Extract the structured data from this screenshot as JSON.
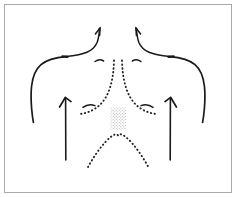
{
  "figure": {
    "title": "Anterior thorax line drawing",
    "background_color": "#ffffff",
    "frame_color": "#a8a8a8",
    "ink_color": "#1a1a1a",
    "dot_color": "#222222",
    "stipple_color": "#c9c9c9",
    "canvas": {
      "width": 236,
      "height": 197
    }
  },
  "elements": {
    "left_neck_line": {
      "name": "left neck contour",
      "style": "solid",
      "arrowhead": "up-right"
    },
    "right_neck_line": {
      "name": "right neck contour",
      "style": "solid",
      "arrowhead": "up-left"
    },
    "left_shoulder_arm": {
      "name": "left shoulder and arm contour",
      "style": "solid"
    },
    "right_shoulder_arm": {
      "name": "right shoulder and arm contour",
      "style": "solid"
    },
    "left_clavicle_mark": {
      "name": "left clavicle notch mark",
      "style": "solid-dot"
    },
    "right_clavicle_mark": {
      "name": "right clavicle notch mark",
      "style": "solid-dot"
    },
    "left_suprasternal_arc": {
      "name": "left suprasternal arc",
      "style": "solid-arc"
    },
    "right_suprasternal_arc": {
      "name": "right suprasternal arc",
      "style": "solid-arc"
    },
    "sternum_dotted_left": {
      "name": "left sternal border dotted line",
      "style": "dotted"
    },
    "sternum_dotted_right": {
      "name": "right sternal border dotted line",
      "style": "dotted"
    },
    "left_inframammary_arc": {
      "name": "left inframammary fold arc",
      "style": "solid-arc"
    },
    "right_inframammary_arc": {
      "name": "right inframammary fold arc",
      "style": "solid-arc"
    },
    "stipple_patch": {
      "name": "xiphoid stippled region",
      "style": "stipple",
      "width": 16,
      "height": 22
    },
    "costal_margin_arch": {
      "name": "costal margin dotted arch",
      "style": "dotted"
    },
    "left_up_arrow": {
      "name": "left chest upward arrow",
      "direction": "up"
    },
    "right_up_arrow": {
      "name": "right chest upward arrow",
      "direction": "up"
    }
  }
}
